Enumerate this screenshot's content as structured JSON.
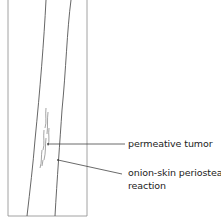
{
  "figure": {
    "colors": {
      "line": "#555555",
      "frame": "#777777",
      "text": "#222222",
      "background": "#ffffff"
    }
  },
  "labels": [
    {
      "id": "permeative-tumor",
      "text": "permeative tumor"
    },
    {
      "id": "onion-skin-line1",
      "text": "onion-skin periosteal"
    },
    {
      "id": "onion-skin-line2",
      "text": "reaction"
    }
  ]
}
